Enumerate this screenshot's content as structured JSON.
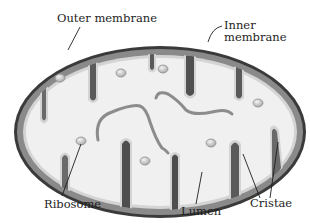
{
  "diagram": {
    "labels": {
      "outer_membrane": "Outer membrane",
      "inner_membrane_line1": "Inner",
      "inner_membrane_line2": "membrane",
      "ribosome": "Ribosome",
      "lumen": "Lumen",
      "cristae": "Cristae"
    },
    "colors": {
      "background": "#ffffff",
      "outer_membrane": "#3a3a3a",
      "intermembrane": "#8a8a8a",
      "inner_highlight": "#d4d4d4",
      "matrix": "#f0f0f0",
      "cristae_fill": "#5a5a5a",
      "dna_strand": "#8c8c8c",
      "ribosome": "#b5b5b5",
      "leader_line": "#1e1e1e",
      "text": "#1e1e1e"
    }
  }
}
